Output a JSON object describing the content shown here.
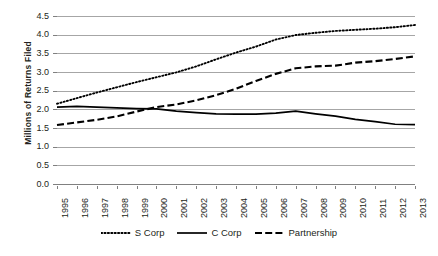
{
  "chart_data": {
    "type": "line",
    "title": "",
    "xlabel": "",
    "ylabel": "Millions of Returns Filed",
    "ylim": [
      0.0,
      4.5
    ],
    "ytick_step": 0.5,
    "grid": true,
    "legend_position": "bottom",
    "categories": [
      "1995",
      "1996",
      "1997",
      "1998",
      "1999",
      "2000",
      "2001",
      "2002",
      "2003",
      "2004",
      "2005",
      "2006",
      "2007",
      "2008",
      "2009",
      "2010",
      "2011",
      "2012",
      "2013"
    ],
    "ytick_labels": [
      "0.0",
      "0.5",
      "1.0",
      "1.5",
      "2.0",
      "2.5",
      "3.0",
      "3.5",
      "4.0",
      "4.5"
    ],
    "series": [
      {
        "name": "S Corp",
        "style": "dotted",
        "color": "#000000",
        "values": [
          2.15,
          2.3,
          2.45,
          2.59,
          2.73,
          2.86,
          2.99,
          3.15,
          3.34,
          3.52,
          3.68,
          3.87,
          3.99,
          4.05,
          4.1,
          4.13,
          4.16,
          4.2,
          4.26
        ]
      },
      {
        "name": "C Corp",
        "style": "solid",
        "color": "#000000",
        "values": [
          2.06,
          2.08,
          2.06,
          2.04,
          2.02,
          2.01,
          1.95,
          1.91,
          1.88,
          1.87,
          1.87,
          1.9,
          1.95,
          1.88,
          1.82,
          1.73,
          1.67,
          1.6,
          1.59
        ]
      },
      {
        "name": "Partnership",
        "style": "dashed",
        "color": "#000000",
        "values": [
          1.58,
          1.65,
          1.72,
          1.81,
          1.94,
          2.06,
          2.13,
          2.24,
          2.38,
          2.55,
          2.76,
          2.95,
          3.1,
          3.15,
          3.17,
          3.25,
          3.29,
          3.35,
          3.42
        ]
      }
    ]
  },
  "legend": {
    "items": [
      {
        "label": "S Corp",
        "style": "dotted"
      },
      {
        "label": "C Corp",
        "style": "solid"
      },
      {
        "label": "Partnership",
        "style": "dashed"
      }
    ]
  }
}
